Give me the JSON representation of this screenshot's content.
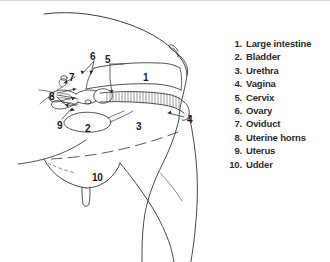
{
  "figure": {
    "type": "anatomical-line-drawing",
    "ink_color": "#3a3a3a",
    "label_color": "#1a1a1a",
    "background_color": "#ffffff"
  },
  "callouts": [
    {
      "number": "1",
      "x": 143,
      "y": 72,
      "refers_to": "Large intestine"
    },
    {
      "number": "2",
      "x": 85,
      "y": 123,
      "refers_to": "Bladder"
    },
    {
      "number": "3",
      "x": 136,
      "y": 121,
      "refers_to": "Urethra"
    },
    {
      "number": "4",
      "x": 187,
      "y": 114,
      "refers_to": "Vagina"
    },
    {
      "number": "5",
      "x": 105,
      "y": 54,
      "refers_to": "Cervix"
    },
    {
      "number": "6",
      "x": 90,
      "y": 51,
      "refers_to": "Ovary"
    },
    {
      "number": "7",
      "x": 69,
      "y": 72,
      "refers_to": "Oviduct"
    },
    {
      "number": "8",
      "x": 49,
      "y": 91,
      "refers_to": "Uterine horns"
    },
    {
      "number": "9",
      "x": 57,
      "y": 120,
      "refers_to": "Uterus"
    },
    {
      "number": "10",
      "x": 92,
      "y": 172,
      "refers_to": "Udder"
    }
  ],
  "legend": {
    "items": [
      {
        "index": "1.",
        "label": "Large intestine"
      },
      {
        "index": "2.",
        "label": "Bladder"
      },
      {
        "index": "3.",
        "label": "Urethra"
      },
      {
        "index": "4.",
        "label": "Vagina"
      },
      {
        "index": "5.",
        "label": "Cervix"
      },
      {
        "index": "6.",
        "label": "Ovary"
      },
      {
        "index": "7.",
        "label": "Oviduct"
      },
      {
        "index": "8.",
        "label": "Uterine horns"
      },
      {
        "index": "9.",
        "label": "Uterus"
      },
      {
        "index": "10.",
        "label": "Udder"
      }
    ]
  }
}
